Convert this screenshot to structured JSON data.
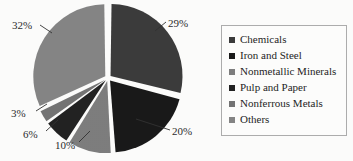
{
  "chart_data": {
    "type": "pie",
    "title": "",
    "subtitle": "",
    "xlabel": "",
    "ylabel": "",
    "grid": false,
    "legend_position": "right",
    "exploded": true,
    "start_angle_deg": 0,
    "direction": "clockwise",
    "categories": [
      "Chemicals",
      "Iron and Steel",
      "Nonmetallic Minerals",
      "Pulp and Paper",
      "Nonferrous Metals",
      "Others"
    ],
    "values": [
      29,
      20,
      10,
      6,
      3,
      32
    ],
    "value_labels": [
      "29%",
      "20%",
      "10%",
      "6%",
      "3%",
      "32%"
    ],
    "unit": "%",
    "colors": [
      "#343434",
      "#111111",
      "#787878",
      "#1a1a1a",
      "#6e6e6e",
      "#808080"
    ],
    "slices": [
      {
        "label": "Chemicals",
        "value": 29,
        "display": "29%",
        "color": "#343434"
      },
      {
        "label": "Iron and Steel",
        "value": 20,
        "display": "20%",
        "color": "#111111"
      },
      {
        "label": "Nonmetallic Minerals",
        "value": 10,
        "display": "10%",
        "color": "#787878"
      },
      {
        "label": "Pulp and Paper",
        "value": 6,
        "display": "6%",
        "color": "#1a1a1a"
      },
      {
        "label": "Nonferrous Metals",
        "value": 3,
        "display": "3%",
        "color": "#6e6e6e"
      },
      {
        "label": "Others",
        "value": 32,
        "display": "32%",
        "color": "#808080"
      }
    ]
  },
  "labels": {
    "chemicals_pct": "29%",
    "iron_and_steel_pct": "20%",
    "nonmetallic_minerals_pct": "10%",
    "pulp_and_paper_pct": "6%",
    "nonferrous_metals_pct": "3%",
    "others_pct": "32%"
  },
  "legend": {
    "items": [
      {
        "label": "Chemicals",
        "color": "#343434"
      },
      {
        "label": "Iron and Steel",
        "color": "#111111"
      },
      {
        "label": "Nonmetallic Minerals",
        "color": "#787878"
      },
      {
        "label": "Pulp and Paper",
        "color": "#1a1a1a"
      },
      {
        "label": "Nonferrous Metals",
        "color": "#6e6e6e"
      },
      {
        "label": "Others",
        "color": "#808080"
      }
    ]
  },
  "style": {
    "background": "#fbfbfa",
    "legend_border": "#a9a9a9",
    "slice_gap": "#ffffff",
    "leader_line": "#2a2a2a",
    "text": "#161616"
  }
}
